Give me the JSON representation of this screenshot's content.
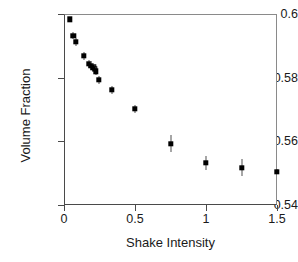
{
  "chart_data": {
    "type": "scatter",
    "title": "",
    "xlabel": "Shake Intensity",
    "ylabel": "Volume Fraction",
    "xlim": [
      0,
      1.5
    ],
    "ylim": [
      0.54,
      0.6
    ],
    "xticks": [
      "0",
      "0.5",
      "1",
      "1.5"
    ],
    "xtick_values": [
      0,
      0.5,
      1,
      1.5
    ],
    "yticks": [
      "0.54",
      "0.56",
      "0.58",
      "0.6"
    ],
    "ytick_values": [
      0.54,
      0.56,
      0.58,
      0.6
    ],
    "grid": false,
    "legend": null,
    "marker": "filled-square",
    "marker_color": "#000000",
    "errorbar_color": "#4f4f4f",
    "series": [
      {
        "name": "Volume Fraction",
        "x": [
          0.04,
          0.065,
          0.085,
          0.14,
          0.175,
          0.19,
          0.205,
          0.215,
          0.225,
          0.245,
          0.335,
          0.5,
          0.75,
          1.0,
          1.25,
          1.5
        ],
        "y": [
          0.5983,
          0.5932,
          0.5913,
          0.5868,
          0.5843,
          0.5838,
          0.5833,
          0.5827,
          0.582,
          0.5793,
          0.5762,
          0.5702,
          0.5593,
          0.5533,
          0.5517,
          0.5505
        ],
        "yerr": [
          0.0006,
          0.0012,
          0.0013,
          0.0013,
          0.0013,
          0.0014,
          0.0014,
          0.0014,
          0.0013,
          0.0012,
          0.0013,
          0.0013,
          0.0026,
          0.0022,
          0.0026,
          0.0009
        ]
      }
    ]
  },
  "axis": {
    "x_title": "Shake Intensity",
    "y_title": "Volume Fraction"
  }
}
